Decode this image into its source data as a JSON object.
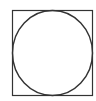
{
  "diagram": {
    "shapes": [
      {
        "type": "square",
        "x": 12,
        "y": 10,
        "width": 80,
        "height": 85,
        "stroke": "#333333"
      },
      {
        "type": "circle",
        "cx": 52,
        "cy": 52.5,
        "r": 41,
        "stroke": "#333333",
        "inscribed_in": "square"
      }
    ],
    "background": "#ffffff"
  }
}
